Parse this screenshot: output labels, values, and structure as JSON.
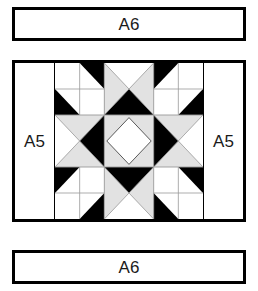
{
  "diagram": {
    "border_strips": [
      {
        "label": "A6",
        "position": "top"
      },
      {
        "label": "A6",
        "position": "bottom"
      }
    ],
    "side_strips": [
      {
        "label": "A5",
        "position": "left"
      },
      {
        "label": "A5",
        "position": "right"
      }
    ],
    "colors": {
      "fabric_dark": "#000000",
      "fabric_light": "#ffffff",
      "fabric_medium": "#e2e2e2",
      "outline": "#000000",
      "seam_line": "#9a9a9a"
    },
    "center_block": {
      "name": "variable star / sawtooth star block",
      "grid": "3x3",
      "units": [
        {
          "row": 1,
          "col": 1,
          "type": "four-patch-half-square-triangles"
        },
        {
          "row": 1,
          "col": 2,
          "type": "quarter-square-triangle",
          "point": "down"
        },
        {
          "row": 1,
          "col": 3,
          "type": "four-patch-half-square-triangles"
        },
        {
          "row": 2,
          "col": 1,
          "type": "quarter-square-triangle",
          "point": "right"
        },
        {
          "row": 2,
          "col": 2,
          "type": "square-on-point"
        },
        {
          "row": 2,
          "col": 3,
          "type": "quarter-square-triangle",
          "point": "left"
        },
        {
          "row": 3,
          "col": 1,
          "type": "four-patch-half-square-triangles"
        },
        {
          "row": 3,
          "col": 2,
          "type": "quarter-square-triangle",
          "point": "up"
        },
        {
          "row": 3,
          "col": 3,
          "type": "four-patch-half-square-triangles"
        }
      ]
    }
  }
}
